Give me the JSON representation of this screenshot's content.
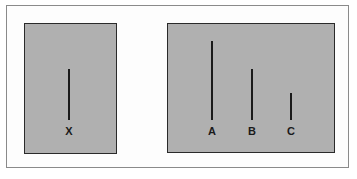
{
  "diagram": {
    "standard_card": {
      "lines": [
        {
          "label": "X",
          "x": 69,
          "top": 69,
          "bottom": 120
        }
      ]
    },
    "comparison_card": {
      "lines": [
        {
          "label": "A",
          "x": 212,
          "top": 41,
          "bottom": 120
        },
        {
          "label": "B",
          "x": 252,
          "top": 69,
          "bottom": 120
        },
        {
          "label": "C",
          "x": 291,
          "top": 93,
          "bottom": 120
        }
      ]
    },
    "colors": {
      "card_fill": "#b0b0b0",
      "line": "#1a1a1a",
      "card_border": "#2a2a2a",
      "frame": "#8a8a8a"
    }
  }
}
